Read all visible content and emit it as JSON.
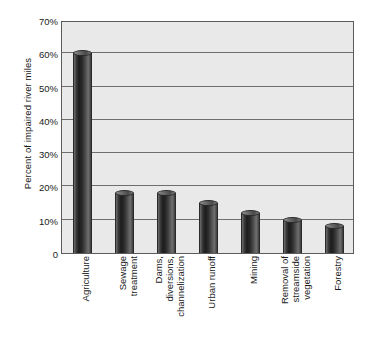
{
  "chart_data": {
    "type": "bar",
    "title": "",
    "xlabel": "",
    "ylabel": "Percent of impaired river miles",
    "ylim": [
      0,
      70
    ],
    "grid": true,
    "legend": "none",
    "y_ticks": [
      "70%",
      "60%",
      "50%",
      "40%",
      "30%",
      "20%",
      "10%",
      "0"
    ],
    "y_tick_values": [
      70,
      60,
      50,
      40,
      30,
      20,
      10,
      0
    ],
    "categories": [
      "Agriculture",
      "Sewage treatment",
      "Dams, diversions, channelization",
      "Urban runoff",
      "Mining",
      "Removal of streamside vegetation",
      "Forestry"
    ],
    "category_lines": [
      [
        "Agriculture"
      ],
      [
        "Sewage",
        "treatment"
      ],
      [
        "Dams,",
        "diversions,",
        "channelization"
      ],
      [
        "Urban runoff"
      ],
      [
        "Mining"
      ],
      [
        "Removal of",
        "streamside",
        "vegetation"
      ],
      [
        "Forestry"
      ]
    ],
    "values": [
      60,
      18,
      18,
      15,
      12,
      10,
      8
    ],
    "bar_color": "#303030",
    "plot_background": "#e9e9e9",
    "gridline_color": "#6e6e6e",
    "axis_color": "#5b5b5b"
  }
}
